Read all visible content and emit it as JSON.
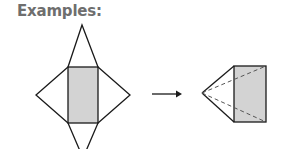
{
  "title": "Examples:",
  "colors": {
    "title": "#6e6e6e",
    "stroke": "#1a1a1a",
    "fill": "#d3d3d3",
    "dashed": "#555555"
  },
  "figures": [
    {
      "name": "net-of-square-pyramid",
      "description": "Rectangle base with four triangular faces unfolded"
    },
    {
      "name": "arrow",
      "description": "Right-pointing arrow indicating folding"
    },
    {
      "name": "folded-pyramid",
      "description": "3D pyramid with shaded face and dashed hidden edges"
    }
  ]
}
